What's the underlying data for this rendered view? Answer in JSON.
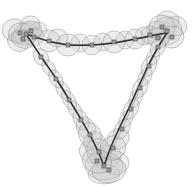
{
  "figure": {
    "title": "",
    "width": 195,
    "height": 186,
    "background": "#ffffff"
  },
  "style": {
    "ellipse_fill": "#c9c9c9",
    "ellipse_fill_opacity": 0.34,
    "ellipse_stroke": "#8a8a8a",
    "ellipse_stroke_opacity": 0.75,
    "ellipse_stroke_width": 0.6,
    "marker_fill": "#9a9a9a",
    "marker_stroke": "#4a4a4a",
    "marker_size": 4,
    "trajectory_color": "#2b2b2b",
    "trajectory_width": 1.5,
    "link_color": "#6e6e6e",
    "link_width": 0.7
  },
  "chart_data": {
    "type": "scatter",
    "title": "",
    "xlabel": "",
    "ylabel": "",
    "xlim": [
      0,
      195
    ],
    "ylim": [
      0,
      186
    ],
    "grid": false,
    "legend": "none",
    "vertices": [
      {
        "name": "corner-top-left",
        "x": 26,
        "y": 34
      },
      {
        "name": "corner-top-right",
        "x": 167,
        "y": 33
      },
      {
        "name": "corner-bottom",
        "x": 104,
        "y": 166
      }
    ],
    "trajectory_paths": [
      {
        "name": "top-edge",
        "points": [
          [
            26,
            34
          ],
          [
            48,
            41
          ],
          [
            70,
            45
          ],
          [
            92,
            45
          ],
          [
            114,
            43
          ],
          [
            136,
            39
          ],
          [
            155,
            35
          ],
          [
            167,
            33
          ]
        ]
      },
      {
        "name": "left-descending-edge",
        "points": [
          [
            26,
            34
          ],
          [
            42,
            58
          ],
          [
            57,
            80
          ],
          [
            70,
            101
          ],
          [
            82,
            121
          ],
          [
            93,
            141
          ],
          [
            100,
            156
          ],
          [
            104,
            166
          ]
        ]
      },
      {
        "name": "right-ascending-edge",
        "points": [
          [
            104,
            166
          ],
          [
            110,
            149
          ],
          [
            118,
            131
          ],
          [
            128,
            110
          ],
          [
            138,
            88
          ],
          [
            149,
            64
          ],
          [
            160,
            44
          ],
          [
            167,
            33
          ]
        ]
      }
    ],
    "poses": [
      {
        "id": 0,
        "x": 26,
        "y": 34,
        "rx": 13,
        "ry": 11,
        "angle": -12,
        "branch": "corner-top-left"
      },
      {
        "id": 1,
        "x": 20,
        "y": 33,
        "rx": 12,
        "ry": 10,
        "angle": -20,
        "branch": "corner-top-left"
      },
      {
        "id": 2,
        "x": 31,
        "y": 31,
        "rx": 11,
        "ry": 10,
        "angle": 8,
        "branch": "corner-top-left"
      },
      {
        "id": 3,
        "x": 23,
        "y": 39,
        "rx": 12,
        "ry": 9,
        "angle": 22,
        "branch": "corner-top-left"
      },
      {
        "id": 4,
        "x": 34,
        "y": 37,
        "rx": 10,
        "ry": 9,
        "angle": -4,
        "branch": "corner-top-left"
      },
      {
        "id": 5,
        "x": 49,
        "y": 41,
        "rx": 11,
        "ry": 11,
        "angle": 0,
        "branch": "top-edge"
      },
      {
        "id": 6,
        "x": 68,
        "y": 45,
        "rx": 12,
        "ry": 11,
        "angle": 4,
        "branch": "top-edge"
      },
      {
        "id": 7,
        "x": 92,
        "y": 45,
        "rx": 10,
        "ry": 10,
        "angle": 0,
        "branch": "top-edge"
      },
      {
        "id": 8,
        "x": 114,
        "y": 42,
        "rx": 11,
        "ry": 11,
        "angle": -4,
        "branch": "top-edge"
      },
      {
        "id": 9,
        "x": 135,
        "y": 39,
        "rx": 10,
        "ry": 10,
        "angle": -6,
        "branch": "top-edge"
      },
      {
        "id": 10,
        "x": 150,
        "y": 35,
        "rx": 9,
        "ry": 9,
        "angle": -10,
        "branch": "top-edge"
      },
      {
        "id": 11,
        "x": 167,
        "y": 31,
        "rx": 15,
        "ry": 14,
        "angle": -8,
        "branch": "corner-top-right"
      },
      {
        "id": 12,
        "x": 162,
        "y": 27,
        "rx": 13,
        "ry": 12,
        "angle": 10,
        "branch": "corner-top-right"
      },
      {
        "id": 13,
        "x": 172,
        "y": 37,
        "rx": 12,
        "ry": 11,
        "angle": -18,
        "branch": "corner-top-right"
      },
      {
        "id": 14,
        "x": 158,
        "y": 38,
        "rx": 11,
        "ry": 10,
        "angle": 26,
        "branch": "corner-top-right"
      },
      {
        "id": 15,
        "x": 41,
        "y": 57,
        "rx": 9,
        "ry": 7,
        "angle": 55,
        "branch": "left-edge"
      },
      {
        "id": 16,
        "x": 56,
        "y": 79,
        "rx": 10,
        "ry": 6,
        "angle": 58,
        "branch": "left-edge"
      },
      {
        "id": 17,
        "x": 69,
        "y": 100,
        "rx": 11,
        "ry": 6,
        "angle": 60,
        "branch": "left-edge"
      },
      {
        "id": 18,
        "x": 81,
        "y": 120,
        "rx": 11,
        "ry": 7,
        "angle": 62,
        "branch": "left-edge"
      },
      {
        "id": 19,
        "x": 90,
        "y": 135,
        "rx": 13,
        "ry": 11,
        "angle": 60,
        "branch": "left-edge"
      },
      {
        "id": 20,
        "x": 99,
        "y": 152,
        "rx": 14,
        "ry": 12,
        "angle": 64,
        "branch": "left-edge"
      },
      {
        "id": 21,
        "x": 104,
        "y": 166,
        "rx": 19,
        "ry": 14,
        "angle": 4,
        "branch": "corner-bottom"
      },
      {
        "id": 22,
        "x": 109,
        "y": 170,
        "rx": 17,
        "ry": 13,
        "angle": -6,
        "branch": "corner-bottom"
      },
      {
        "id": 23,
        "x": 97,
        "y": 161,
        "rx": 15,
        "ry": 12,
        "angle": 18,
        "branch": "corner-bottom"
      },
      {
        "id": 24,
        "x": 113,
        "y": 148,
        "rx": 13,
        "ry": 12,
        "angle": -30,
        "branch": "right-edge"
      },
      {
        "id": 25,
        "x": 122,
        "y": 129,
        "rx": 11,
        "ry": 7,
        "angle": -58,
        "branch": "right-edge"
      },
      {
        "id": 26,
        "x": 131,
        "y": 109,
        "rx": 11,
        "ry": 7,
        "angle": -60,
        "branch": "right-edge"
      },
      {
        "id": 27,
        "x": 140,
        "y": 88,
        "rx": 11,
        "ry": 7,
        "angle": -62,
        "branch": "right-edge"
      },
      {
        "id": 28,
        "x": 149,
        "y": 66,
        "rx": 11,
        "ry": 7,
        "angle": -64,
        "branch": "right-edge"
      },
      {
        "id": 29,
        "x": 158,
        "y": 47,
        "rx": 10,
        "ry": 7,
        "angle": -66,
        "branch": "right-edge"
      }
    ],
    "extra_ellipses": [
      {
        "x": 14,
        "y": 30,
        "rx": 12,
        "ry": 11,
        "angle": -14
      },
      {
        "x": 18,
        "y": 42,
        "rx": 11,
        "ry": 9,
        "angle": 30
      },
      {
        "x": 38,
        "y": 30,
        "rx": 9,
        "ry": 8,
        "angle": 0
      },
      {
        "x": 58,
        "y": 38,
        "rx": 10,
        "ry": 9,
        "angle": 6
      },
      {
        "x": 80,
        "y": 43,
        "rx": 9,
        "ry": 9,
        "angle": 0
      },
      {
        "x": 103,
        "y": 42,
        "rx": 9,
        "ry": 9,
        "angle": 0
      },
      {
        "x": 125,
        "y": 40,
        "rx": 9,
        "ry": 9,
        "angle": -4
      },
      {
        "x": 144,
        "y": 36,
        "rx": 9,
        "ry": 9,
        "angle": -8
      },
      {
        "x": 176,
        "y": 26,
        "rx": 11,
        "ry": 10,
        "angle": 8
      },
      {
        "x": 153,
        "y": 57,
        "rx": 9,
        "ry": 6,
        "angle": -62
      },
      {
        "x": 145,
        "y": 77,
        "rx": 10,
        "ry": 6,
        "angle": -62
      },
      {
        "x": 136,
        "y": 98,
        "rx": 10,
        "ry": 6,
        "angle": -60
      },
      {
        "x": 126,
        "y": 119,
        "rx": 10,
        "ry": 6,
        "angle": -58
      },
      {
        "x": 118,
        "y": 139,
        "rx": 12,
        "ry": 10,
        "angle": -40
      },
      {
        "x": 49,
        "y": 68,
        "rx": 9,
        "ry": 6,
        "angle": 56
      },
      {
        "x": 63,
        "y": 90,
        "rx": 10,
        "ry": 6,
        "angle": 58
      },
      {
        "x": 75,
        "y": 110,
        "rx": 10,
        "ry": 6,
        "angle": 60
      },
      {
        "x": 86,
        "y": 128,
        "rx": 12,
        "ry": 9,
        "angle": 60
      },
      {
        "x": 95,
        "y": 144,
        "rx": 13,
        "ry": 11,
        "angle": 62
      },
      {
        "x": 106,
        "y": 157,
        "rx": 15,
        "ry": 12,
        "angle": -10
      },
      {
        "x": 115,
        "y": 163,
        "rx": 14,
        "ry": 12,
        "angle": 0
      },
      {
        "x": 92,
        "y": 152,
        "rx": 13,
        "ry": 11,
        "angle": 20
      },
      {
        "x": 104,
        "y": 174,
        "rx": 16,
        "ry": 10,
        "angle": 0
      },
      {
        "x": 30,
        "y": 25,
        "rx": 10,
        "ry": 9,
        "angle": -18
      },
      {
        "x": 168,
        "y": 20,
        "rx": 11,
        "ry": 9,
        "angle": 12
      },
      {
        "x": 157,
        "y": 30,
        "rx": 10,
        "ry": 9,
        "angle": -6
      }
    ],
    "graph_links": [
      [
        26,
        34,
        49,
        41
      ],
      [
        49,
        41,
        68,
        45
      ],
      [
        68,
        45,
        92,
        45
      ],
      [
        92,
        45,
        114,
        42
      ],
      [
        114,
        42,
        135,
        39
      ],
      [
        135,
        39,
        150,
        35
      ],
      [
        150,
        35,
        167,
        31
      ],
      [
        26,
        34,
        41,
        57
      ],
      [
        41,
        57,
        56,
        79
      ],
      [
        56,
        79,
        69,
        100
      ],
      [
        69,
        100,
        81,
        120
      ],
      [
        81,
        120,
        90,
        135
      ],
      [
        90,
        135,
        99,
        152
      ],
      [
        99,
        152,
        104,
        166
      ],
      [
        104,
        166,
        113,
        148
      ],
      [
        113,
        148,
        122,
        129
      ],
      [
        122,
        129,
        131,
        109
      ],
      [
        131,
        109,
        140,
        88
      ],
      [
        140,
        88,
        149,
        66
      ],
      [
        149,
        66,
        158,
        47
      ],
      [
        158,
        47,
        167,
        31
      ]
    ]
  }
}
